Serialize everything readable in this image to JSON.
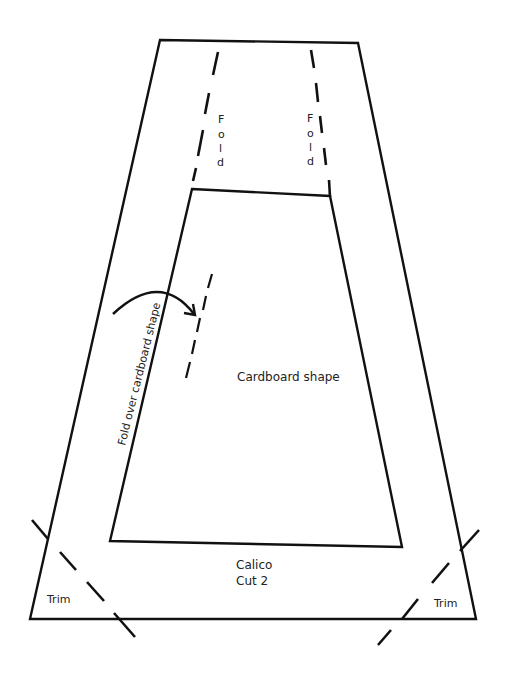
{
  "diagram": {
    "type": "sewing-pattern",
    "stroke_color": "#111111",
    "background": "#ffffff",
    "outer_shape": {
      "name": "calico-piece",
      "points": [
        [
          160,
          40
        ],
        [
          358,
          43
        ],
        [
          476,
          619
        ],
        [
          30,
          619
        ]
      ]
    },
    "inner_shape": {
      "name": "cardboard-shape",
      "points": [
        [
          192,
          189
        ],
        [
          330,
          196
        ],
        [
          402,
          547
        ],
        [
          110,
          541
        ]
      ]
    },
    "labels": {
      "fold_left": [
        "F",
        "o",
        "l",
        "d"
      ],
      "fold_right": [
        "F",
        "o",
        "l",
        "d"
      ],
      "fold_over": "Fold over cardboard shape",
      "cardboard": "Cardboard shape",
      "material": "Calico",
      "cut": "Cut 2",
      "trim_left": "Trim",
      "trim_right": "Trim"
    },
    "fold_lines": {
      "left": [
        [
          218,
          52,
          213,
          75
        ],
        [
          209,
          93,
          205,
          114
        ],
        [
          203,
          130,
          198,
          156
        ],
        [
          196,
          168,
          193,
          181
        ]
      ],
      "right": [
        [
          311,
          50,
          314,
          68
        ],
        [
          316,
          83,
          318,
          102
        ],
        [
          320,
          116,
          322,
          133
        ],
        [
          324,
          148,
          326,
          165
        ],
        [
          329,
          180,
          330,
          197
        ]
      ]
    },
    "center_dash": [
      [
        212,
        274,
        208,
        288
      ],
      [
        206,
        296,
        203,
        310
      ],
      [
        200,
        318,
        197,
        332
      ],
      [
        195,
        340,
        192,
        354
      ],
      [
        190,
        362,
        186,
        378
      ]
    ],
    "trim_lines": {
      "left": [
        [
          32,
          520,
          48,
          539
        ],
        [
          60,
          552,
          76,
          570
        ],
        [
          87,
          582,
          104,
          601
        ],
        [
          114,
          613,
          135,
          637
        ]
      ],
      "right": [
        [
          479,
          530,
          460,
          551
        ],
        [
          449,
          563,
          432,
          583
        ],
        [
          418,
          599,
          402,
          619
        ],
        [
          391,
          630,
          378,
          645
        ]
      ]
    },
    "arrow": {
      "path": "M113,314 Q160,270 194,314",
      "head": [
        [
          184,
          313
        ],
        [
          195,
          315
        ],
        [
          193,
          304
        ]
      ]
    }
  }
}
